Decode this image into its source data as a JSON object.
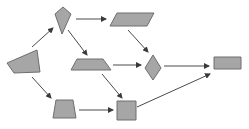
{
  "diagram": {
    "title": "",
    "colors": {
      "background": "#ffffff",
      "node_fill": "#a6a6a6",
      "node_stroke": "#6e6e6e",
      "edge": "#4a4a4a"
    },
    "nodes": [
      {
        "id": "n1",
        "shape": "irregular-quadrilateral",
        "points": "7,63 37,50 40,72 14,73"
      },
      {
        "id": "n2",
        "shape": "kite",
        "points": "55,14 63,7 71,14 62,34"
      },
      {
        "id": "n3",
        "shape": "parallelogram",
        "points": "117,13 154,13 147,26 110,26"
      },
      {
        "id": "n4",
        "shape": "trapezoid",
        "points": "77,59 103,59 111,70 71,70"
      },
      {
        "id": "n5",
        "shape": "diamond",
        "points": "153,55 161,68 153,80 145,68"
      },
      {
        "id": "n6",
        "shape": "rectangle",
        "points": "214,57 241,57 241,69 214,69"
      },
      {
        "id": "n7",
        "shape": "trapezoid",
        "points": "56,100 73,100 76,118 53,118"
      },
      {
        "id": "n8",
        "shape": "square",
        "points": "117,101 136,101 136,120 117,120"
      }
    ],
    "edges": [
      {
        "from": "n1",
        "to": "n2",
        "x1": 32,
        "y1": 47,
        "x2": 53,
        "y2": 28
      },
      {
        "from": "n2",
        "to": "n3",
        "x1": 76,
        "y1": 19,
        "x2": 106,
        "y2": 19
      },
      {
        "from": "n2",
        "to": "n4",
        "x1": 68,
        "y1": 30,
        "x2": 87,
        "y2": 55
      },
      {
        "from": "n3",
        "to": "n5",
        "x1": 128,
        "y1": 30,
        "x2": 148,
        "y2": 52
      },
      {
        "from": "n4",
        "to": "n5",
        "x1": 113,
        "y1": 65,
        "x2": 141,
        "y2": 65
      },
      {
        "from": "n5",
        "to": "n6",
        "x1": 164,
        "y1": 66,
        "x2": 209,
        "y2": 66
      },
      {
        "from": "n1",
        "to": "n7",
        "x1": 32,
        "y1": 77,
        "x2": 51,
        "y2": 98
      },
      {
        "from": "n4",
        "to": "n8",
        "x1": 102,
        "y1": 74,
        "x2": 122,
        "y2": 98
      },
      {
        "from": "n7",
        "to": "n8",
        "x1": 79,
        "y1": 110,
        "x2": 113,
        "y2": 110
      },
      {
        "from": "n8",
        "to": "n6",
        "x1": 137,
        "y1": 107,
        "x2": 210,
        "y2": 74
      }
    ]
  }
}
